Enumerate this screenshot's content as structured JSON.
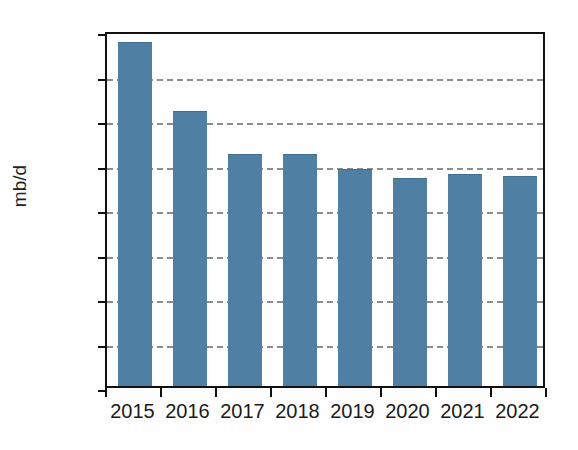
{
  "figure": {
    "title_remnant": "",
    "background_color": "#ffffff"
  },
  "axes": {
    "ylabel": "mb/d",
    "xlabel": "",
    "y_ticks": [
      "4.4",
      "4.2",
      "4.0",
      "3.8",
      "3.6",
      "3.4",
      "3.2",
      "3.0",
      "2.8"
    ],
    "x_ticks": [
      "2015",
      "2016",
      "2017",
      "2018",
      "2019",
      "2020",
      "2021",
      "2022"
    ]
  },
  "style": {
    "bar_color": "#4f80a4",
    "grid_color": "#8d8d8d",
    "axis_color": "#111111",
    "text_color": "#1a1a1a"
  },
  "chart_data": {
    "type": "bar",
    "title": "",
    "xlabel": "",
    "ylabel": "mb/d",
    "categories": [
      "2015",
      "2016",
      "2017",
      "2018",
      "2019",
      "2020",
      "2021",
      "2022"
    ],
    "values": [
      4.34,
      4.03,
      3.84,
      3.84,
      3.77,
      3.73,
      3.75,
      3.74
    ],
    "ylim": [
      2.8,
      4.4
    ],
    "ytick_values": [
      2.8,
      3.0,
      3.2,
      3.4,
      3.6,
      3.8,
      4.0,
      4.2,
      4.4
    ],
    "grid": "horizontal-dashed",
    "legend": "none",
    "series": [
      {
        "name": "mb/d",
        "values": [
          4.34,
          4.03,
          3.84,
          3.84,
          3.77,
          3.73,
          3.75,
          3.74
        ],
        "color": "#4f80a4"
      }
    ]
  }
}
